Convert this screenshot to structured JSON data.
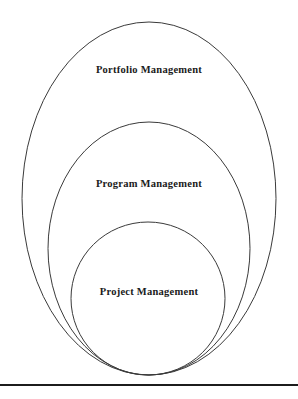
{
  "diagram": {
    "type": "nested-ellipses",
    "title": "",
    "background_color": "#ffffff",
    "stroke_color": "#3a3a3a",
    "text_color": "#1a1a1a",
    "rings": [
      {
        "id": "portfolio",
        "label": "Portfolio Management",
        "level": 1,
        "shape": "ellipse",
        "cx": 149,
        "cy": 198.5,
        "rx": 127,
        "ry": 176.5
      },
      {
        "id": "program",
        "label": "Program Management",
        "level": 2,
        "shape": "ellipse",
        "cx": 149,
        "cy": 248.5,
        "rx": 101,
        "ry": 126.5
      },
      {
        "id": "project",
        "label": "Project Management",
        "level": 3,
        "shape": "circle",
        "cx": 148,
        "cy": 298.5,
        "rx": 77,
        "ry": 76.5
      }
    ],
    "footer_rule": {
      "label": "horizontal-rule",
      "color": "#1c1c1c",
      "thickness": 2
    }
  }
}
